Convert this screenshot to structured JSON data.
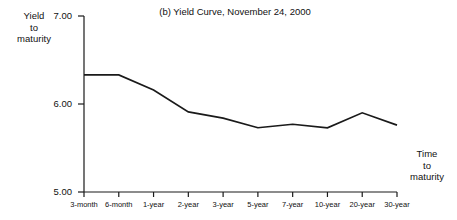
{
  "chart_data": {
    "type": "line",
    "title": "(b) Yield Curve, November 24, 2000",
    "xlabel": "Time to maturity",
    "ylabel": "Yield to maturity",
    "categories": [
      "3-month",
      "6-month",
      "1-year",
      "2-year",
      "3-year",
      "5-year",
      "7-year",
      "10-year",
      "20-year",
      "30-year"
    ],
    "values": [
      6.33,
      6.33,
      6.16,
      5.91,
      5.84,
      5.73,
      5.77,
      5.73,
      5.9,
      5.76
    ],
    "ylim": [
      5.0,
      7.0
    ],
    "ytick_labels": [
      "7.00",
      "6.00",
      "5.00"
    ],
    "ytick_values": [
      7.0,
      6.0,
      5.0
    ],
    "grid": false,
    "legend": "none",
    "line_color": "#1a1a1a"
  },
  "axis_labels": {
    "y_line1": "Yield",
    "y_line2": "to",
    "y_line3": "maturity",
    "x_line1": "Time",
    "x_line2": "to",
    "x_line3": "maturity"
  }
}
